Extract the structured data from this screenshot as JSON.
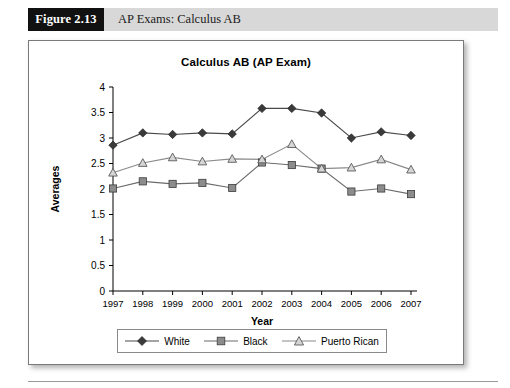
{
  "figure": {
    "number_label": "Figure 2.13",
    "caption": "AP Exams: Calculus AB"
  },
  "chart_data": {
    "type": "line",
    "title": "Calculus AB (AP Exam)",
    "xlabel": "Year",
    "ylabel": "Averages",
    "categories": [
      "1997",
      "1998",
      "1999",
      "2000",
      "2001",
      "2002",
      "2003",
      "2004",
      "2005",
      "2006",
      "2007"
    ],
    "ylim": [
      0,
      4
    ],
    "ytick_labels": [
      "0",
      "0.5",
      "1",
      "1.5",
      "2",
      "2.5",
      "3",
      "3.5",
      "4"
    ],
    "ytick_values": [
      0,
      0.5,
      1,
      1.5,
      2,
      2.5,
      3,
      3.5,
      4
    ],
    "grid": false,
    "legend_position": "bottom",
    "series": [
      {
        "name": "White",
        "marker": "filled-diamond",
        "color": "#3a3a3a",
        "values": [
          2.86,
          3.1,
          3.07,
          3.1,
          3.08,
          3.58,
          3.58,
          3.49,
          3.0,
          3.12,
          3.05
        ]
      },
      {
        "name": "Black",
        "marker": "filled-square",
        "color": "#8c8c8c",
        "values": [
          2.01,
          2.15,
          2.1,
          2.12,
          2.02,
          2.52,
          2.47,
          2.4,
          1.95,
          2.01,
          1.9
        ]
      },
      {
        "name": "Puerto Rican",
        "marker": "open-triangle",
        "color": "#d5d5d5",
        "values": [
          2.32,
          2.51,
          2.62,
          2.54,
          2.59,
          2.58,
          2.88,
          2.4,
          2.42,
          2.58,
          2.38
        ]
      }
    ]
  },
  "legend": {
    "items": [
      {
        "label": "White"
      },
      {
        "label": "Black"
      },
      {
        "label": "Puerto Rican"
      }
    ]
  }
}
